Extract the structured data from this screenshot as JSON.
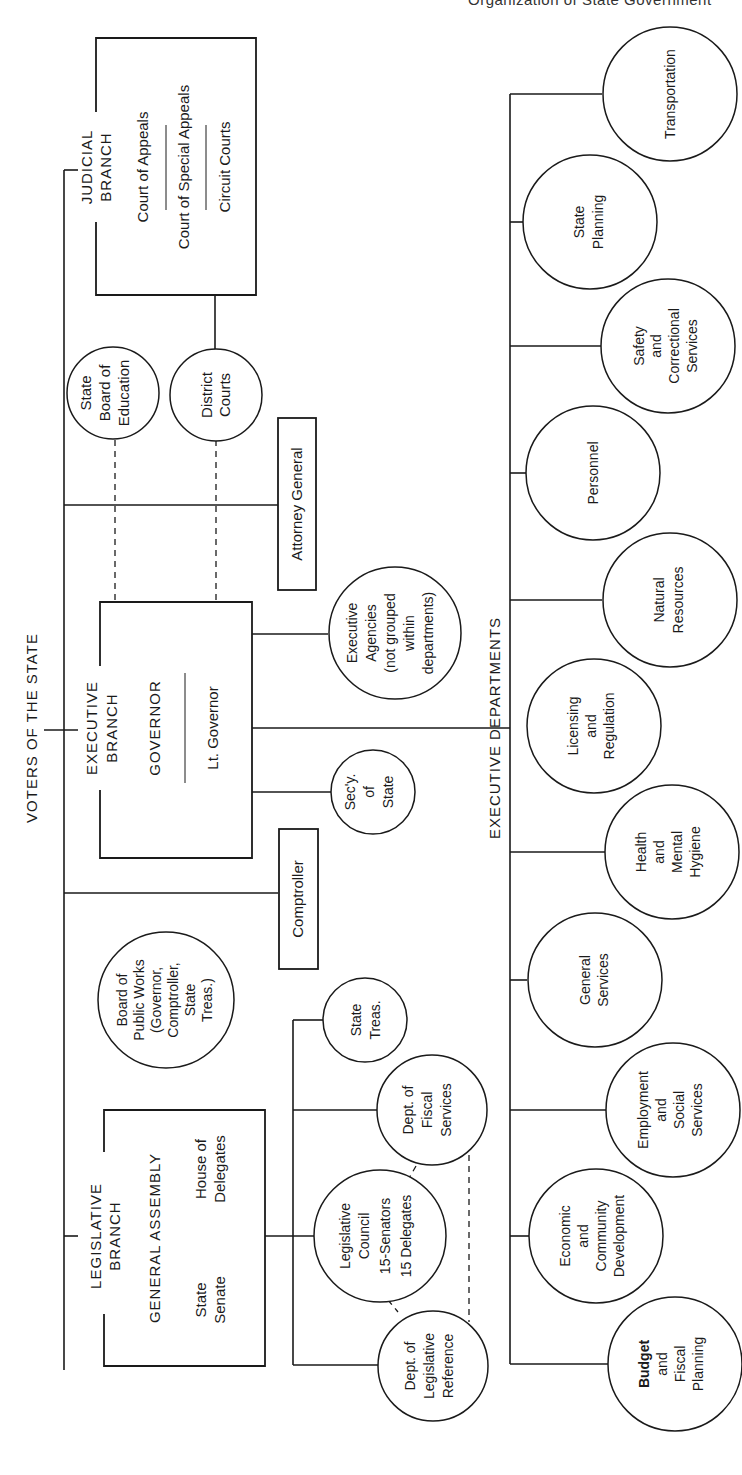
{
  "page_header": "Organization of State Government",
  "root": {
    "label": "VOTERS OF THE STATE"
  },
  "judicial": {
    "title_line1": "JUDICIAL",
    "title_line2": "BRANCH",
    "courts": [
      "Court of Appeals",
      "Court of Special Appeals",
      "Circuit Courts"
    ],
    "district_courts": [
      "District",
      "Courts"
    ]
  },
  "state_board_of_education": [
    "State",
    "Board of",
    "Education"
  ],
  "attorney_general": "Attorney General",
  "executive": {
    "title_line1": "EXECUTIVE",
    "title_line2": "BRANCH",
    "governor": "GOVERNOR",
    "lt_governor": "Lt. Governor",
    "executive_agencies": [
      "Executive",
      "Agencies",
      "(not grouped",
      "within",
      "departments)"
    ],
    "secretary_of_state": [
      "Sec'y.",
      "of",
      "State"
    ]
  },
  "comptroller": "Comptroller",
  "board_of_public_works": [
    "Board of",
    "Public Works",
    "(Governor,",
    "Comptroller,",
    "State",
    "Treas.)"
  ],
  "legislative": {
    "title_line1": "LEGISLATIVE",
    "title_line2": "BRANCH",
    "general_assembly": "GENERAL ASSEMBLY",
    "state_senate": [
      "State",
      "Senate"
    ],
    "house_of_delegates": [
      "House of",
      "Delegates"
    ],
    "state_treasurer": [
      "State",
      "Treas."
    ],
    "dept_fiscal_services": [
      "Dept. of",
      "Fiscal",
      "Services"
    ],
    "legislative_council": [
      "Legislative",
      "Council",
      "15-Senators",
      "15 Delegates"
    ],
    "dept_legislative_reference": [
      "Dept. of",
      "Legislative",
      "Reference"
    ]
  },
  "executive_departments": {
    "label": "EXECUTIVE DEPARTMENTS",
    "departments": [
      {
        "lines": [
          "Transportation"
        ]
      },
      {
        "lines": [
          "State",
          "Planning"
        ]
      },
      {
        "lines": [
          "Safety",
          "and",
          "Correctional",
          "Services"
        ]
      },
      {
        "lines": [
          "Personnel"
        ]
      },
      {
        "lines": [
          "Natural",
          "Resources"
        ]
      },
      {
        "lines": [
          "Licensing",
          "and",
          "Regulation"
        ]
      },
      {
        "lines": [
          "Health",
          "and",
          "Mental",
          "Hygiene"
        ]
      },
      {
        "lines": [
          "General",
          "Services"
        ]
      },
      {
        "lines": [
          "Employment",
          "and",
          "Social",
          "Services"
        ]
      },
      {
        "lines": [
          "Economic",
          "and",
          "Community",
          "Development"
        ]
      },
      {
        "lines": [
          "Budget",
          "and",
          "Fiscal",
          "Planning"
        ]
      }
    ]
  },
  "colors": {
    "ink": "#1a1a1a",
    "paper": "#ffffff"
  }
}
